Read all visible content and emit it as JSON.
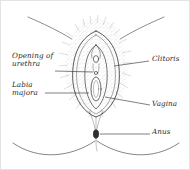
{
  "figure": {
    "background_color": "#ffffff",
    "line_color": "#3a3a3a",
    "text_color": "#2b2b2b",
    "border_color": "#e3e3e3",
    "style": "pen-and-ink line drawing with stipple shading"
  },
  "labels": [
    {
      "id": "urethra",
      "text": "Opening of\nurethra",
      "side": "left",
      "x": 11,
      "y": 54,
      "leader": {
        "x1": 54,
        "y1": 70,
        "x2": 92,
        "y2": 71
      }
    },
    {
      "id": "labia-majora",
      "text": "Labia\nmajora",
      "side": "left",
      "x": 11,
      "y": 83,
      "leader": {
        "x1": 44,
        "y1": 92,
        "x2": 88,
        "y2": 92
      }
    },
    {
      "id": "clitoris",
      "text": "Clitoris",
      "side": "right",
      "x": 151,
      "y": 56,
      "leader": {
        "x1": 113,
        "y1": 65,
        "x2": 148,
        "y2": 60
      }
    },
    {
      "id": "vagina",
      "text": "Vagina",
      "side": "right",
      "x": 151,
      "y": 100,
      "leader": {
        "x1": 104,
        "y1": 96,
        "x2": 149,
        "y2": 104
      }
    },
    {
      "id": "anus",
      "text": "Anus",
      "side": "right",
      "x": 151,
      "y": 128,
      "leader": {
        "x1": 99,
        "y1": 133,
        "x2": 149,
        "y2": 133
      }
    }
  ],
  "anatomy_parts": [
    "mons-pubis-hair",
    "labia-majora-outline",
    "labia-minora-outline",
    "clitoris",
    "urethral-opening",
    "vaginal-opening",
    "perineum",
    "anus",
    "groin-crease-left",
    "groin-crease-right",
    "buttock-curve-left",
    "buttock-curve-right"
  ]
}
